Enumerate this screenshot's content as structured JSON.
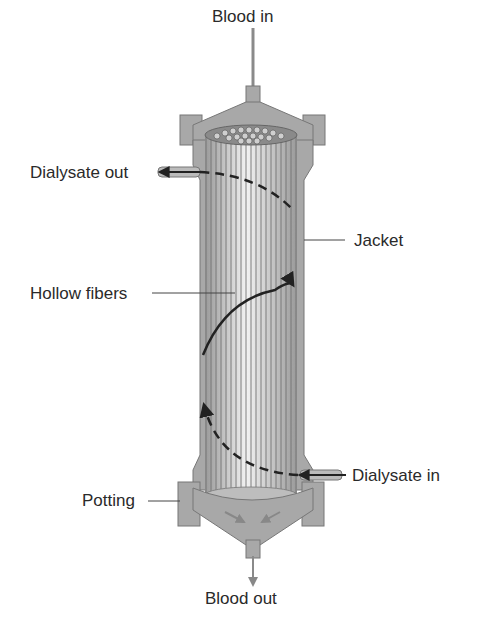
{
  "labels": {
    "blood_in": "Blood in",
    "dialysate_out": "Dialysate out",
    "jacket": "Jacket",
    "hollow_fibers": "Hollow fibers",
    "dialysate_in": "Dialysate in",
    "potting": "Potting",
    "blood_out": "Blood out"
  },
  "colors": {
    "housing": "#a8a8a8",
    "housing_dark": "#7e7e7e",
    "fiber_light": "#e8e8e8",
    "fiber_line": "#6a6a6a",
    "flow_line": "#222222",
    "text": "#2a2a2a"
  }
}
